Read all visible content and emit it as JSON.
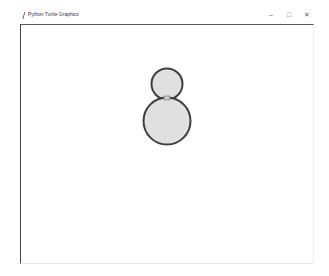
{
  "window": {
    "title": "Python Turtle Graphics",
    "controls": {
      "minimize": "–",
      "maximize": "□",
      "close": "✕"
    }
  },
  "canvas": {
    "background": "#ffffff",
    "shapes": [
      {
        "type": "circle",
        "name": "small-circle",
        "cx": 167,
        "cy": 84,
        "r": 16,
        "fill": "#e0e0e0",
        "stroke": "#404040"
      },
      {
        "type": "circle",
        "name": "large-circle",
        "cx": 167,
        "cy": 121,
        "r": 24,
        "fill": "#e0e0e0",
        "stroke": "#404040"
      }
    ],
    "turtle": {
      "x": 167,
      "y": 98,
      "color": "#555555"
    }
  }
}
